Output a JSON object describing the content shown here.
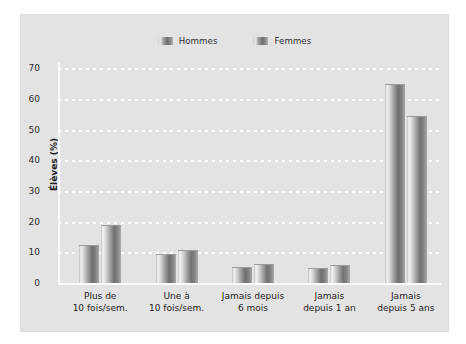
{
  "chart_data": {
    "type": "bar",
    "title": "",
    "xlabel": "",
    "ylabel": "Élèves (%)",
    "ylim": [
      0,
      72
    ],
    "yticks": [
      0,
      10,
      20,
      30,
      40,
      50,
      60,
      70
    ],
    "grid": true,
    "legend_position": "top-center",
    "categories": [
      "Plus de\n10 fois/sem.",
      "Une à\n10 fois/sem.",
      "Jamais depuis\n6 mois",
      "Jamais\ndepuis 1 an",
      "Jamais\ndepuis 5 ans"
    ],
    "category_lines": [
      [
        "Plus de",
        "10 fois/sem."
      ],
      [
        "Une à",
        "10 fois/sem."
      ],
      [
        "Jamais depuis",
        "6 mois"
      ],
      [
        "Jamais",
        "depuis 1 an"
      ],
      [
        "Jamais",
        "depuis 5 ans"
      ]
    ],
    "series": [
      {
        "name": "Hommes",
        "values": [
          12,
          9,
          5,
          4.5,
          64.5
        ]
      },
      {
        "name": "Femmes",
        "values": [
          18.5,
          10.5,
          6,
          5.5,
          54
        ]
      }
    ]
  },
  "legend": {
    "items": [
      {
        "label": "Hommes"
      },
      {
        "label": "Femmes"
      }
    ]
  },
  "axis": {
    "y_title": "Élèves (%)",
    "y_tick_labels": [
      "0",
      "10",
      "20",
      "30",
      "40",
      "50",
      "60",
      "70"
    ]
  },
  "colors": {
    "page_background": "#ffffff",
    "plate_background": "#e3e3e3",
    "gridline": "#ffffff",
    "axis_line": "#fafafa",
    "bar_light": "#f2f2f2",
    "bar_dark": "#6f6f6f",
    "text": "#242424"
  }
}
